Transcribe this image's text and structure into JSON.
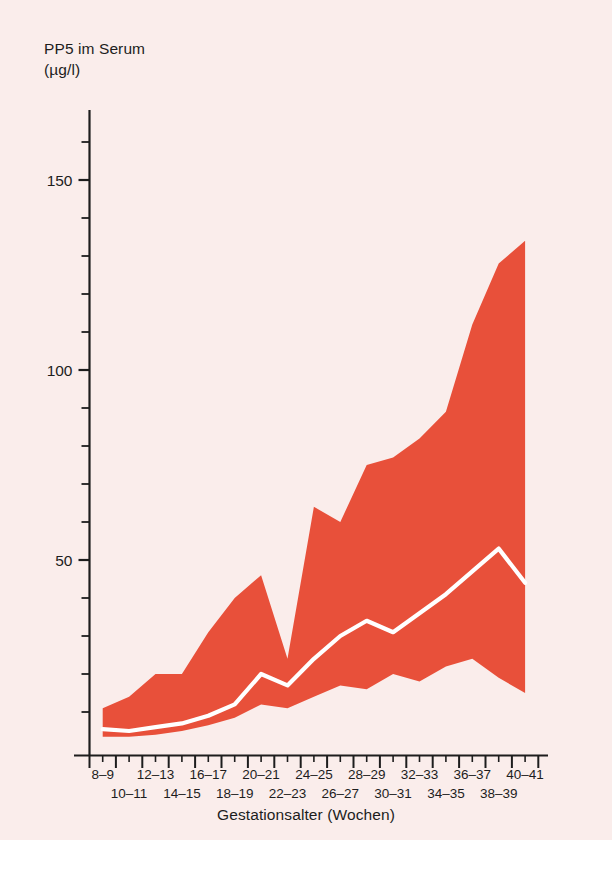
{
  "figure": {
    "background_color": "#faedeb",
    "band_color": "#e8503a",
    "median_color": "#ffffff",
    "axis_color": "#1d1d1d"
  },
  "y_axis": {
    "title_line1": "PP5 im Serum",
    "title_line2": "(µg/l)",
    "tick_labels": [
      "150",
      "100",
      "50"
    ],
    "tick_values": [
      150,
      100,
      50
    ]
  },
  "x_axis": {
    "title": "Gestationsalter (Wochen)",
    "labels_top": [
      "8–9",
      "12–13",
      "16–17",
      "20–21",
      "24–25",
      "28–29",
      "32–33",
      "36–37",
      "40–41"
    ],
    "labels_bottom": [
      "10–11",
      "14–15",
      "18–19",
      "22–23",
      "26–27",
      "30–31",
      "34–35",
      "38–39"
    ]
  },
  "caption": {
    "text": ""
  },
  "chart_data": {
    "type": "area",
    "xlabel": "Gestationsalter (Wochen)",
    "ylabel": "PP5 im Serum (µg/l)",
    "ylim": [
      0,
      168
    ],
    "yticks": [
      50,
      100,
      150
    ],
    "yminor_step": 10,
    "grid": false,
    "legend": "none",
    "categories": [
      "8–9",
      "10–11",
      "12–13",
      "14–15",
      "16–17",
      "18–19",
      "20–21",
      "22–23",
      "24–25",
      "26–27",
      "28–29",
      "30–31",
      "32–33",
      "34–35",
      "36–37",
      "38–39",
      "40–41"
    ],
    "series": [
      {
        "name": "upper",
        "values": [
          11,
          14,
          20,
          20,
          31,
          40,
          46,
          24,
          64,
          60,
          75,
          77,
          82,
          89,
          112,
          128,
          134
        ]
      },
      {
        "name": "median",
        "values": [
          5.5,
          5,
          6,
          7,
          9,
          12,
          20,
          17,
          24,
          30,
          34,
          31,
          36,
          41,
          47,
          53,
          44
        ]
      },
      {
        "name": "lower",
        "values": [
          3.5,
          3.5,
          4,
          5,
          6.5,
          8.5,
          12,
          11,
          14,
          17,
          16,
          20,
          18,
          22,
          24,
          19,
          15
        ]
      }
    ]
  }
}
